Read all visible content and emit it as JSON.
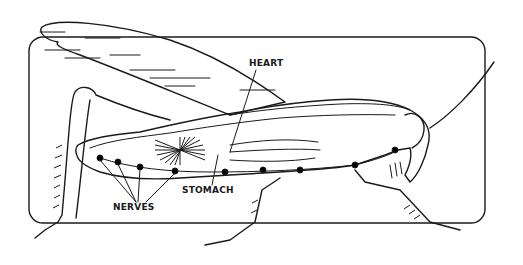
{
  "diagram": {
    "labels": {
      "heart": "HEART",
      "stomach": "STOMACH",
      "nerves": "NERVES"
    },
    "colors": {
      "ink": "#1a1a1a",
      "background": "#ffffff"
    }
  }
}
